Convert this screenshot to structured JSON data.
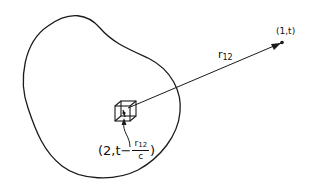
{
  "diagram": {
    "point_field": {
      "label": "(1,t)"
    },
    "distance": {
      "symbol": "r",
      "subscript": "12"
    },
    "point_source": {
      "prefix": "(2,t",
      "minus": "−",
      "fraction_num_symbol": "r",
      "fraction_num_subscript": "12",
      "fraction_den": "c",
      "suffix": ")"
    },
    "colors": {
      "stroke": "#1a1a1a",
      "background": "#ffffff"
    }
  }
}
